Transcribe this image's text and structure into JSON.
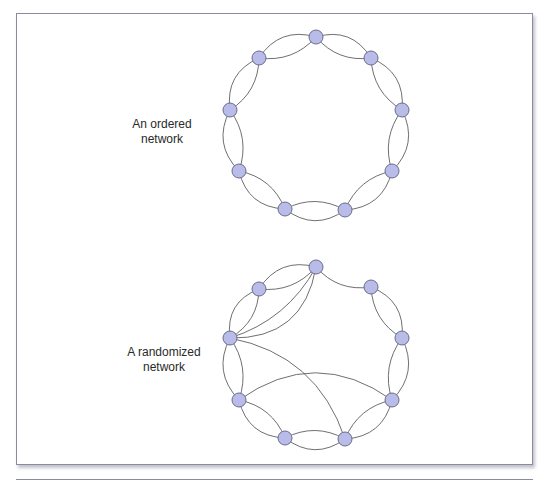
{
  "colors": {
    "frame_border": "#8a8aa2",
    "edge": "#4a4a4a",
    "node_fill": "#b9bbe8",
    "node_stroke": "#6a6c8c",
    "text": "#2a2a2a"
  },
  "node_radius": 7,
  "networks": [
    {
      "id": "ordered",
      "label_line1": "An ordered",
      "label_line2": "network",
      "label_pos": {
        "x": 107,
        "y": 117
      },
      "nodes": [
        {
          "id": "top",
          "x": 316,
          "y": 37
        },
        {
          "id": "upper-right",
          "x": 371,
          "y": 58
        },
        {
          "id": "right",
          "x": 402,
          "y": 110
        },
        {
          "id": "lower-right",
          "x": 392,
          "y": 171
        },
        {
          "id": "bottom-right",
          "x": 345,
          "y": 210
        },
        {
          "id": "bottom-left",
          "x": 285,
          "y": 209
        },
        {
          "id": "lower-left",
          "x": 239,
          "y": 171
        },
        {
          "id": "left",
          "x": 230,
          "y": 110
        },
        {
          "id": "upper-left",
          "x": 259,
          "y": 58
        }
      ],
      "edges": [
        {
          "from": "top",
          "to": "upper-right",
          "curve": 10
        },
        {
          "from": "top",
          "to": "upper-right",
          "curve": -14
        },
        {
          "from": "upper-right",
          "to": "right",
          "curve": 10
        },
        {
          "from": "upper-right",
          "to": "right",
          "curve": -14
        },
        {
          "from": "right",
          "to": "lower-right",
          "curve": 10
        },
        {
          "from": "right",
          "to": "lower-right",
          "curve": -14
        },
        {
          "from": "lower-right",
          "to": "bottom-right",
          "curve": 10
        },
        {
          "from": "lower-right",
          "to": "bottom-right",
          "curve": -14
        },
        {
          "from": "bottom-right",
          "to": "bottom-left",
          "curve": 10
        },
        {
          "from": "bottom-right",
          "to": "bottom-left",
          "curve": -14
        },
        {
          "from": "bottom-left",
          "to": "lower-left",
          "curve": 10
        },
        {
          "from": "bottom-left",
          "to": "lower-left",
          "curve": -14
        },
        {
          "from": "lower-left",
          "to": "left",
          "curve": 10
        },
        {
          "from": "lower-left",
          "to": "left",
          "curve": -14
        },
        {
          "from": "left",
          "to": "upper-left",
          "curve": 10
        },
        {
          "from": "left",
          "to": "upper-left",
          "curve": -14
        },
        {
          "from": "upper-left",
          "to": "top",
          "curve": 10
        },
        {
          "from": "upper-left",
          "to": "top",
          "curve": -14
        }
      ]
    },
    {
      "id": "randomized",
      "label_line1": "A randomized",
      "label_line2": "network",
      "label_pos": {
        "x": 109,
        "y": 345
      },
      "nodes": [
        {
          "id": "top",
          "x": 316,
          "y": 267
        },
        {
          "id": "upper-right",
          "x": 371,
          "y": 287
        },
        {
          "id": "right",
          "x": 402,
          "y": 338
        },
        {
          "id": "lower-right",
          "x": 392,
          "y": 400
        },
        {
          "id": "bottom-right",
          "x": 345,
          "y": 439
        },
        {
          "id": "bottom-left",
          "x": 285,
          "y": 438
        },
        {
          "id": "lower-left",
          "x": 239,
          "y": 400
        },
        {
          "id": "left",
          "x": 230,
          "y": 338
        },
        {
          "id": "upper-left",
          "x": 259,
          "y": 289
        }
      ],
      "edges": [
        {
          "from": "top",
          "to": "upper-right",
          "curve": 10
        },
        {
          "from": "upper-right",
          "to": "right",
          "curve": 10
        },
        {
          "from": "upper-right",
          "to": "right",
          "curve": -14
        },
        {
          "from": "right",
          "to": "lower-right",
          "curve": 10
        },
        {
          "from": "right",
          "to": "lower-right",
          "curve": -14
        },
        {
          "from": "lower-right",
          "to": "bottom-right",
          "curve": 10
        },
        {
          "from": "lower-right",
          "to": "bottom-right",
          "curve": -14
        },
        {
          "from": "bottom-right",
          "to": "bottom-left",
          "curve": 10
        },
        {
          "from": "bottom-right",
          "to": "bottom-left",
          "curve": -14
        },
        {
          "from": "bottom-left",
          "to": "lower-left",
          "curve": 10
        },
        {
          "from": "bottom-left",
          "to": "lower-left",
          "curve": -14
        },
        {
          "from": "lower-left",
          "to": "left",
          "curve": 10
        },
        {
          "from": "lower-left",
          "to": "left",
          "curve": -14
        },
        {
          "from": "left",
          "to": "upper-left",
          "curve": 10
        },
        {
          "from": "left",
          "to": "upper-left",
          "curve": -14
        },
        {
          "from": "upper-left",
          "to": "top",
          "curve": 10
        },
        {
          "from": "upper-left",
          "to": "top",
          "curve": -14
        },
        {
          "from": "top",
          "to": "left",
          "curve": -14
        },
        {
          "from": "top",
          "to": "left",
          "curve": -30
        },
        {
          "from": "left",
          "to": "bottom-right",
          "curve": -28
        },
        {
          "from": "lower-left",
          "to": "lower-right",
          "curve": -34
        }
      ]
    }
  ]
}
